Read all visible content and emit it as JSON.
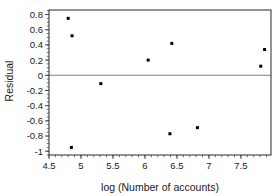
{
  "chart_data": {
    "type": "scatter",
    "title": "",
    "subtitle": "",
    "xlabel": "log (Number of accounts)",
    "ylabel": "Residual",
    "xlim": [
      4.5,
      7.97
    ],
    "ylim": [
      -1.05,
      0.86
    ],
    "grid": false,
    "legend": null,
    "reference_lines": [
      {
        "name": "zero-residual-line",
        "axis": "y",
        "value": 0
      }
    ],
    "x_ticks": [
      4.5,
      5,
      5.5,
      6,
      6.5,
      7,
      7.5
    ],
    "x_tick_labels": [
      "4.5",
      "5",
      "5.5",
      "6",
      "6.5",
      "7",
      "7.5"
    ],
    "x_minor_tick_step": 0.1,
    "y_ticks": [
      0.8,
      0.6,
      0.4,
      0.2,
      0,
      -0.2,
      -0.4,
      -0.6,
      -0.8,
      -1
    ],
    "y_tick_labels": [
      "0.8",
      "0.6",
      "0.4",
      "0.2",
      "0",
      "-0.2",
      "-0.4",
      "-0.6",
      "-0.8",
      "-1"
    ],
    "y_minor_tick_step": 0.05,
    "x": [
      4.8,
      4.85,
      4.86,
      5.31,
      6.05,
      6.39,
      6.42,
      6.82,
      7.81,
      7.87
    ],
    "y": [
      0.75,
      -0.95,
      0.52,
      -0.11,
      0.2,
      -0.77,
      0.42,
      -0.69,
      0.12,
      0.34
    ],
    "points": [
      {
        "x": 4.8,
        "y": 0.75
      },
      {
        "x": 4.85,
        "y": -0.95
      },
      {
        "x": 4.86,
        "y": 0.52
      },
      {
        "x": 5.31,
        "y": -0.11
      },
      {
        "x": 6.05,
        "y": 0.2
      },
      {
        "x": 6.39,
        "y": -0.77
      },
      {
        "x": 6.42,
        "y": 0.42
      },
      {
        "x": 6.82,
        "y": -0.69
      },
      {
        "x": 7.81,
        "y": 0.12
      },
      {
        "x": 7.87,
        "y": 0.34
      }
    ],
    "marker": {
      "shape": "square",
      "size": 3,
      "color": "#000000"
    },
    "colors": {
      "marker": "#000000",
      "frame": "#3a3a3a",
      "zero_line": "#808080",
      "text": "#1a1a1a",
      "background": "#ffffff"
    }
  }
}
